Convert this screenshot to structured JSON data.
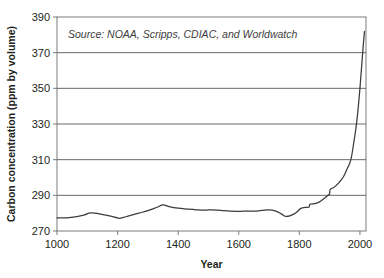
{
  "chart_data": {
    "type": "line",
    "title": "",
    "subtitle": "",
    "xlabel": "Year",
    "ylabel": "Carbon concentration (ppm by volume)",
    "annotation": "Source: NOAA, Scripps, CDIAC, and Worldwatch",
    "grid": true,
    "legend": "none",
    "line_color": "#3b3b3d",
    "grid_color": "#58595b",
    "axis_color": "#6d6e71",
    "background": "#ffffff",
    "xlim": [
      1000,
      2020
    ],
    "ylim": [
      270,
      390
    ],
    "xticks": [
      1000,
      1200,
      1400,
      1600,
      1800,
      2000
    ],
    "xtick_labels": [
      "1000",
      "1200",
      "1400",
      "1600",
      "1800",
      "2000"
    ],
    "yticks": [
      270,
      290,
      310,
      330,
      350,
      370,
      390
    ],
    "ytick_labels": [
      "270",
      "290",
      "310",
      "330",
      "350",
      "370",
      "390"
    ],
    "series": [
      {
        "name": "Atmospheric carbon concentration",
        "x": [
          1000,
          1030,
          1060,
          1090,
          1110,
          1140,
          1170,
          1200,
          1210,
          1240,
          1270,
          1300,
          1330,
          1350,
          1370,
          1400,
          1430,
          1460,
          1490,
          1510,
          1540,
          1570,
          1600,
          1625,
          1650,
          1675,
          1700,
          1720,
          1740,
          1755,
          1770,
          1790,
          1805,
          1820,
          1832,
          1835,
          1850,
          1865,
          1880,
          1895,
          1900,
          1902,
          1915,
          1930,
          1945,
          1958,
          1970,
          1980,
          1990,
          2000,
          2010,
          2015
        ],
        "y": [
          277.3,
          277.4,
          277.9,
          279.0,
          280.1,
          279.6,
          278.6,
          277.3,
          277.2,
          278.6,
          280.0,
          281.4,
          283.3,
          284.6,
          283.7,
          282.8,
          282.3,
          281.9,
          281.7,
          281.9,
          281.6,
          281.2,
          281.0,
          281.2,
          281.1,
          281.5,
          281.9,
          281.3,
          279.6,
          278.2,
          278.6,
          280.4,
          282.7,
          283.2,
          283.4,
          285.0,
          285.4,
          286.2,
          288.0,
          290.0,
          291.0,
          293.3,
          294.6,
          297.0,
          300.3,
          305.0,
          310.0,
          320.0,
          332.0,
          350.0,
          372.0,
          382.0
        ]
      }
    ]
  },
  "layout": {
    "plot_left": 57,
    "plot_top": 17,
    "plot_right": 366,
    "plot_bottom": 231
  }
}
